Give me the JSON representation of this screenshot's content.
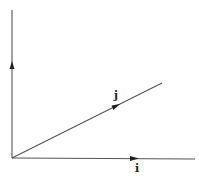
{
  "diagram": {
    "axes": [
      {
        "name": "vertical-axis",
        "direction": "up",
        "has_arrow": true
      },
      {
        "name": "horizontal-axis",
        "direction": "right",
        "has_arrow": true,
        "label": "i"
      }
    ],
    "vectors": [
      {
        "name": "j-vector",
        "label": "j",
        "angle_deg": 26,
        "has_arrow": true
      }
    ],
    "labels": {
      "i": "i",
      "j": "j"
    },
    "caption": ""
  }
}
